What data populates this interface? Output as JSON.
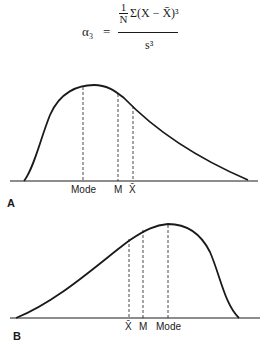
{
  "formula": {
    "lhs": "α₃",
    "equals": "=",
    "numerator_fraction_top": "1",
    "numerator_fraction_bottom": "N",
    "numerator_sum": "Σ(X − X̄)³",
    "denominator": "s³"
  },
  "panels": [
    {
      "id": "A",
      "label": "A",
      "description": "Positively skewed distribution",
      "markers": [
        {
          "name": "mode",
          "label": "Mode"
        },
        {
          "name": "median",
          "label": "M"
        },
        {
          "name": "mean",
          "label": "X̄"
        }
      ]
    },
    {
      "id": "B",
      "label": "B",
      "description": "Negatively skewed distribution",
      "markers": [
        {
          "name": "mean",
          "label": "X̄"
        },
        {
          "name": "median",
          "label": "M"
        },
        {
          "name": "mode",
          "label": "Mode"
        }
      ]
    }
  ],
  "colors": {
    "ink": "#1a1a1a",
    "background": "#ffffff"
  }
}
